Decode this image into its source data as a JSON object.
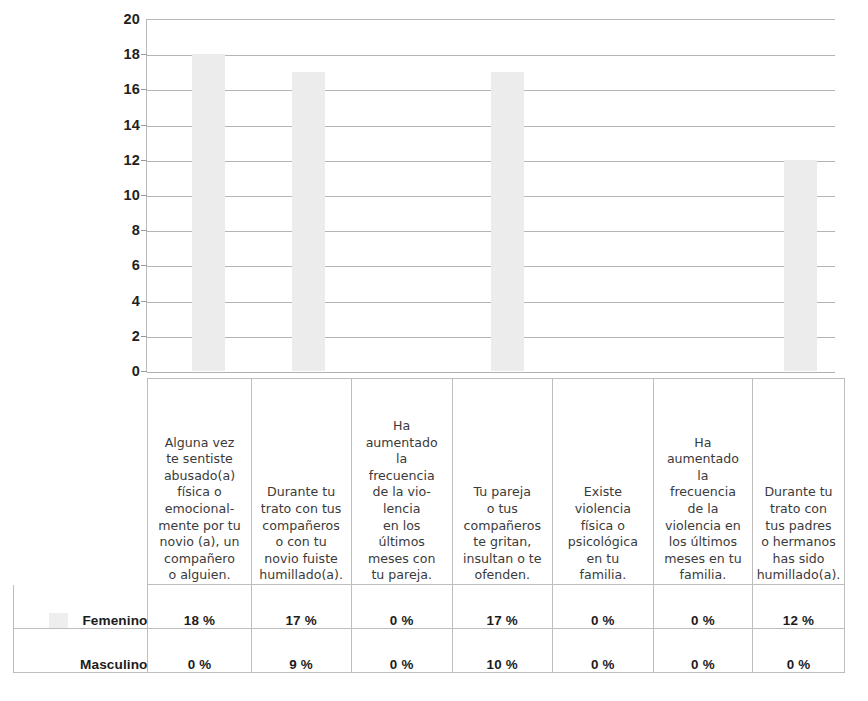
{
  "chart_data": {
    "type": "bar",
    "title": "",
    "subtitle": "",
    "xlabel": "",
    "ylabel": "",
    "ylim": [
      0,
      20
    ],
    "yticks": [
      0,
      2,
      4,
      6,
      8,
      10,
      12,
      14,
      16,
      18,
      20
    ],
    "grid": true,
    "legend_position": "table-left",
    "categories": [
      "Alguna vez te sentiste abusado(a) física o emocionalmente por tu novio (a), un compañero o alguien.",
      "Durante tu trato con tus compañeros o con tu novio fuiste humillado(a).",
      "Ha aumentado la frecuencia de la violencia en los últimos meses con tu pareja.",
      "Tu pareja o tus compañeros te gritan, insultan o te ofenden.",
      "Existe violencia física o psicológica en tu familia.",
      "Ha aumentado la frecuencia de la violencia en los últimos meses en tu familia.",
      "Durante tu trato con tus padres o hermanos has sido humillado(a)."
    ],
    "categories_wrapped": [
      [
        "Alguna vez",
        "te sentiste",
        "abusado(a)",
        "física o",
        "emocional-",
        "mente por tu",
        "novio (a), un",
        "compañero",
        "o alguien."
      ],
      [
        "Durante tu",
        "trato con tus",
        "compañeros",
        "o con tu",
        "novio fuiste",
        "humillado(a)."
      ],
      [
        "Ha",
        "aumentado",
        "la",
        "frecuencia",
        "de la vio-",
        "lencia",
        "en los",
        "últimos",
        "meses con",
        "tu pareja."
      ],
      [
        "Tu pareja",
        "o tus",
        "compañeros",
        "te gritan,",
        "insultan o te",
        "ofenden."
      ],
      [
        "Existe",
        "violencia",
        "física o",
        "psicológica",
        "en tu",
        "familia."
      ],
      [
        "Ha",
        "aumentado",
        "la",
        "frecuencia",
        "de la",
        "violencia en",
        "los últimos",
        "meses en tu",
        "familia."
      ],
      [
        "Durante tu",
        "trato con",
        "tus padres",
        "o hermanos",
        "has sido",
        "humillado(a)."
      ]
    ],
    "series": [
      {
        "name": "Femenino",
        "values": [
          18,
          17,
          0,
          17,
          0,
          0,
          12
        ],
        "labels": [
          "18 %",
          "17 %",
          "0 %",
          "17 %",
          "0 %",
          "0 %",
          "12 %"
        ],
        "color": "#ececec",
        "plotted": true
      },
      {
        "name": "Masculino",
        "values": [
          0,
          9,
          0,
          10,
          0,
          0,
          0
        ],
        "labels": [
          "0 %",
          "9 %",
          "0 %",
          "10 %",
          "0 %",
          "0 %",
          "0 %"
        ],
        "color": "#ffffff",
        "plotted": false
      }
    ]
  },
  "colors": {
    "bar_fill": "#ececec",
    "gridline": "#b4b4b4",
    "axis": "#b9b9b9",
    "table_border": "#bdbdbd",
    "text": "#1c1c1c",
    "category_text": "#3b3b3b"
  }
}
